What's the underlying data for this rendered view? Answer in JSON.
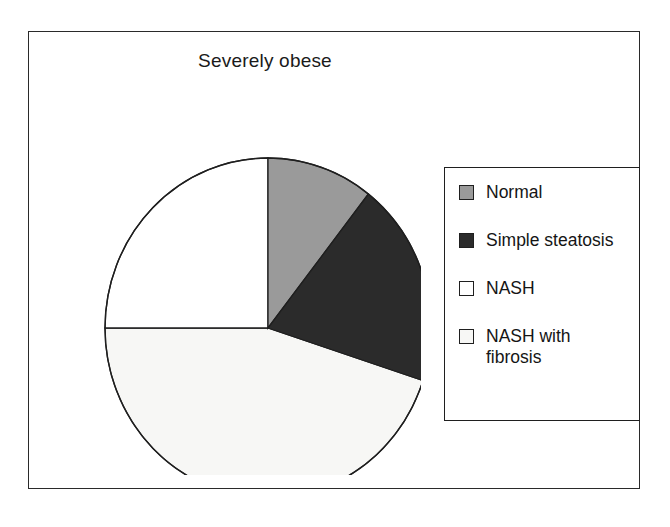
{
  "figure": {
    "title": "Severely obese",
    "frame": {
      "border_color": "#2a2a2a"
    },
    "background": "#ffffff"
  },
  "legend": {
    "border_color": "#1f1f1f",
    "items": [
      {
        "label": "Normal",
        "label_line2": "",
        "color": "#9a9a9a",
        "swatch_name": "legend-swatch-normal"
      },
      {
        "label": "Simple steatosis",
        "label_line2": "",
        "color": "#2b2b2b",
        "swatch_name": "legend-swatch-simple-steatosis"
      },
      {
        "label": "NASH",
        "label_line2": "",
        "color": "#ffffff",
        "swatch_name": "legend-swatch-nash"
      },
      {
        "label": "NASH with",
        "label_line2": "fibrosis",
        "color": "#f7f7f5",
        "swatch_name": "legend-swatch-nash-with-fibrosis"
      }
    ]
  },
  "chart_data": {
    "type": "pie",
    "title": "Severely obese",
    "xlabel": "",
    "ylabel": "",
    "categories": [
      "Normal",
      "Simple steatosis",
      "NASH",
      "NASH with fibrosis"
    ],
    "values": [
      10.6,
      19.4,
      25.0,
      45.0
    ],
    "units": "percent",
    "start_angle_deg": 0,
    "direction": "clockwise",
    "slice_angles_deg": [
      38,
      70,
      90,
      162
    ],
    "slice_boundaries_deg": [
      0,
      38,
      108,
      270,
      360
    ],
    "colors": [
      "#9a9a9a",
      "#2b2b2b",
      "#ffffff",
      "#f7f7f5"
    ],
    "slice_edge_color": "#1f1f1f",
    "legend_position": "right",
    "grid": false,
    "labels_on_slices": false
  }
}
